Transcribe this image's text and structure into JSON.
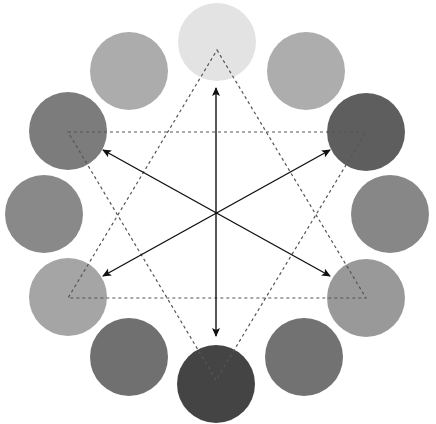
{
  "diagram": {
    "width": 436,
    "height": 424,
    "center": [
      216,
      212
    ],
    "circle_radius": 39,
    "circles": [
      {
        "id": "top",
        "cx": 217,
        "cy": 42,
        "fill": "#e3e3e3"
      },
      {
        "id": "top-right",
        "cx": 306,
        "cy": 71,
        "fill": "#adadad"
      },
      {
        "id": "right-upper",
        "cx": 366,
        "cy": 132,
        "fill": "#5e5e5e"
      },
      {
        "id": "right-middle",
        "cx": 390,
        "cy": 214,
        "fill": "#878787"
      },
      {
        "id": "right-lower",
        "cx": 366,
        "cy": 298,
        "fill": "#999999"
      },
      {
        "id": "bottom-right",
        "cx": 304,
        "cy": 357,
        "fill": "#727272"
      },
      {
        "id": "bottom",
        "cx": 216,
        "cy": 384,
        "fill": "#444444"
      },
      {
        "id": "bottom-left",
        "cx": 129,
        "cy": 357,
        "fill": "#707070"
      },
      {
        "id": "left-lower",
        "cx": 68,
        "cy": 297,
        "fill": "#a5a5a5"
      },
      {
        "id": "left-middle",
        "cx": 44,
        "cy": 214,
        "fill": "#898989"
      },
      {
        "id": "left-upper",
        "cx": 68,
        "cy": 131,
        "fill": "#7c7c7c"
      },
      {
        "id": "top-left",
        "cx": 129,
        "cy": 71,
        "fill": "#acacac"
      }
    ],
    "triangles": [
      {
        "id": "triangle-up",
        "points": "217,50 366,298 68,298",
        "stroke": "#555555",
        "dash": "3,3"
      },
      {
        "id": "triangle-down",
        "points": "68,132 366,132 216,380",
        "stroke": "#555555",
        "dash": "3,3"
      }
    ],
    "arrows": [
      {
        "id": "arrow-vertical",
        "x1": 216,
        "y1": 336,
        "x2": 216,
        "y2": 88
      },
      {
        "id": "arrow-diagonal-a",
        "x1": 330,
        "y1": 276,
        "x2": 103,
        "y2": 150
      },
      {
        "id": "arrow-diagonal-b",
        "x1": 103,
        "y1": 276,
        "x2": 330,
        "y2": 150
      }
    ],
    "arrow_color": "#111111"
  }
}
